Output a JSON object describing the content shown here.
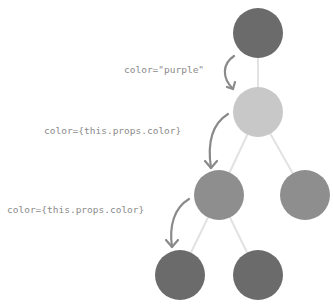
{
  "diagram": {
    "type": "component-tree-prop-flow",
    "colors": {
      "edge": "#e2e2e2",
      "arrow": "#8a8a8a",
      "label": "#8a8a8a"
    },
    "nodes": [
      {
        "id": "root",
        "cx": 258,
        "cy": 33,
        "r": 25,
        "fill": "#6b6b6b"
      },
      {
        "id": "child",
        "cx": 258,
        "cy": 112,
        "r": 25,
        "fill": "#c8c8c8"
      },
      {
        "id": "grandchild-left",
        "cx": 219,
        "cy": 195,
        "r": 25,
        "fill": "#8e8e8e"
      },
      {
        "id": "grandchild-right",
        "cx": 305,
        "cy": 195,
        "r": 25,
        "fill": "#8e8e8e"
      },
      {
        "id": "leaf-left",
        "cx": 180,
        "cy": 275,
        "r": 25,
        "fill": "#6b6b6b"
      },
      {
        "id": "leaf-right",
        "cx": 258,
        "cy": 275,
        "r": 25,
        "fill": "#6b6b6b"
      }
    ],
    "edges": [
      {
        "from": "root",
        "to": "child"
      },
      {
        "from": "child",
        "to": "grandchild-left"
      },
      {
        "from": "child",
        "to": "grandchild-right"
      },
      {
        "from": "grandchild-left",
        "to": "leaf-left"
      },
      {
        "from": "grandchild-left",
        "to": "leaf-right"
      }
    ],
    "labels": [
      {
        "id": "prop-root",
        "text": "color=\"purple\"",
        "x": 124,
        "y": 64
      },
      {
        "id": "prop-child",
        "text": "color={this.props.color}",
        "x": 44,
        "y": 125
      },
      {
        "id": "prop-grandchild",
        "text": "color={this.props.color}",
        "x": 7,
        "y": 204
      }
    ],
    "arrows": [
      {
        "id": "arrow-1",
        "path": "M234,56 C222,64 222,78 233,89",
        "head": [
          [
            227,
            87
          ],
          [
            233,
            89
          ],
          [
            235,
            82
          ]
        ]
      },
      {
        "id": "arrow-2",
        "path": "M228,114 C212,124 207,142 211,168",
        "head": [
          [
            205,
            161
          ],
          [
            211,
            168
          ],
          [
            217,
            161
          ]
        ]
      },
      {
        "id": "arrow-3",
        "path": "M189,199 C174,208 169,226 172,247",
        "head": [
          [
            166,
            240
          ],
          [
            172,
            247
          ],
          [
            178,
            240
          ]
        ]
      }
    ]
  }
}
